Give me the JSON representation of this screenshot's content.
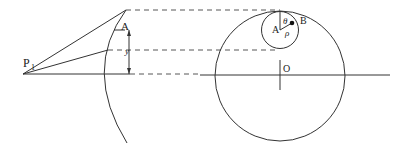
{
  "diagram": {
    "labels": {
      "p1": "P",
      "p1_sub": "1",
      "a_left": "A",
      "y": "y",
      "a_right": "A",
      "b": "B",
      "theta": "θ",
      "rho": "ρ",
      "o": "O"
    },
    "colors": {
      "line": "#333333",
      "background": "#ffffff"
    }
  }
}
